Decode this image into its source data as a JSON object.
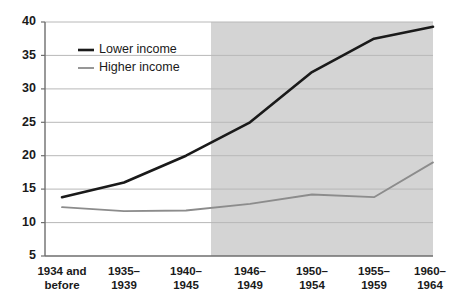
{
  "chart_data": {
    "type": "line",
    "title": "",
    "subtitle": "",
    "xlabel": "",
    "ylabel": "",
    "categories": [
      "1934 and before",
      "1935–1939",
      "1940–1945",
      "1946–1949",
      "1950–1954",
      "1955–1959",
      "1960–1964"
    ],
    "category_lines": [
      [
        "1934 and",
        "before"
      ],
      [
        "1935–",
        "1939"
      ],
      [
        "1940–",
        "1945"
      ],
      [
        "1946–",
        "1949"
      ],
      [
        "1950–",
        "1954"
      ],
      [
        "1955–",
        "1959"
      ],
      [
        "1960–",
        "1964"
      ]
    ],
    "series": [
      {
        "name": "Lower income",
        "color": "#1a1a1a",
        "values": [
          13.8,
          16.0,
          20.0,
          25.0,
          32.5,
          37.5,
          39.3
        ]
      },
      {
        "name": "Higher income",
        "color": "#8c8c8c",
        "values": [
          12.3,
          11.7,
          11.8,
          12.8,
          14.2,
          13.8,
          19.0
        ]
      }
    ],
    "ylim": [
      5,
      40
    ],
    "yticks": [
      5,
      10,
      15,
      20,
      25,
      30,
      35,
      40
    ],
    "ytick_labels": [
      "5",
      "10",
      "15",
      "20",
      "25",
      "30",
      "35",
      "40"
    ],
    "grid": true,
    "grid_color": "#b8b8b8",
    "legend_position": "upper-left-inside",
    "shaded_region": {
      "from_category": "1946–1949",
      "to_category": "1960–1964",
      "color": "#d4d4d4"
    },
    "plot_background": "#ffffff",
    "axis_color": "#6e6e6e"
  },
  "legend": {
    "entries": [
      {
        "label": "Lower income",
        "color": "#1a1a1a"
      },
      {
        "label": "Higher income",
        "color": "#8c8c8c"
      }
    ]
  }
}
